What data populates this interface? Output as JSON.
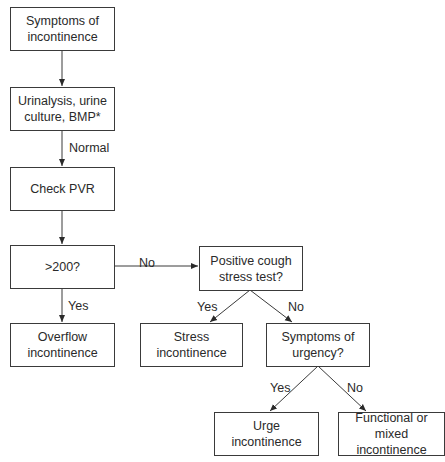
{
  "diagram": {
    "type": "flowchart",
    "nodes": {
      "symptoms": "Symptoms of incontinence",
      "tests": "Urinalysis, urine culture, BMP*",
      "pvr": "Check PVR",
      "gt200": ">200?",
      "overflow": "Overflow incontinence",
      "cough": "Positive cough stress test?",
      "stress": "Stress incontinence",
      "urgency": "Symptoms of urgency?",
      "urge": "Urge incontinence",
      "functional": "Functional or mixed incontinence"
    },
    "edge_labels": {
      "normal": "Normal",
      "gt200_no": "No",
      "gt200_yes": "Yes",
      "cough_yes": "Yes",
      "cough_no": "No",
      "urgency_yes": "Yes",
      "urgency_no": "No"
    }
  }
}
